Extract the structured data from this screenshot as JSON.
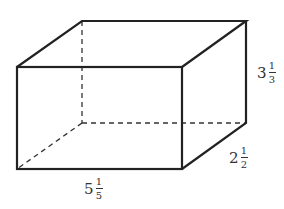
{
  "diagram": {
    "type": "rectangular-prism",
    "stroke_color": "#222222",
    "hidden_edge_style": "dashed",
    "vertices": {
      "front_top_left": [
        17,
        67
      ],
      "front_top_right": [
        182,
        67
      ],
      "front_bottom_right": [
        182,
        169
      ],
      "front_bottom_left": [
        17,
        169
      ],
      "back_top_left": [
        82,
        21
      ],
      "back_top_right": [
        246,
        21
      ],
      "back_bottom_right": [
        246,
        123
      ],
      "back_bottom_left": [
        82,
        123
      ]
    },
    "dimensions": {
      "height": {
        "whole": "3",
        "numerator": "1",
        "denominator": "3",
        "text": "3 1/3"
      },
      "depth": {
        "whole": "2",
        "numerator": "1",
        "denominator": "2",
        "text": "2 1/2"
      },
      "length": {
        "whole": "5",
        "numerator": "1",
        "denominator": "5",
        "text": "5 1/5"
      }
    }
  }
}
